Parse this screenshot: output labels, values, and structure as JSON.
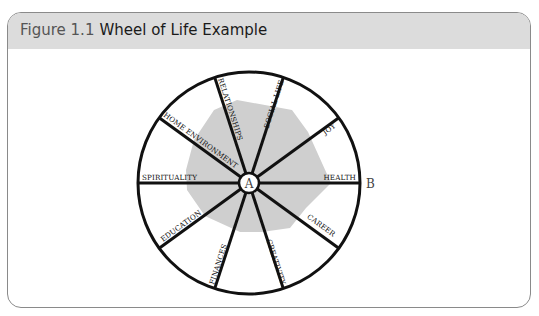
{
  "figure": {
    "number": "Figure 1.1",
    "title": "Wheel of Life Example"
  },
  "wheel": {
    "center_label": "A",
    "rim_label": "B",
    "segments": [
      {
        "label": "HEALTH",
        "angle": 0
      },
      {
        "label": "CAREER",
        "angle": 36
      },
      {
        "label": "CREATIVITY",
        "angle": 72
      },
      {
        "label": "FINANCES",
        "angle": 108
      },
      {
        "label": "EDUCATION",
        "angle": 144
      },
      {
        "label": "SPIRITUALITY",
        "angle": 180
      },
      {
        "label": "HOME ENVIRONMENT",
        "angle": 216
      },
      {
        "label": "RELATIONSHIPS",
        "angle": 252
      },
      {
        "label": "SOCIAL LIFE",
        "angle": 288
      },
      {
        "label": "JOY",
        "angle": 324
      }
    ],
    "colors": {
      "header_bg": "#dcdcdc",
      "shade": "#cfcfcf",
      "line": "#111111",
      "border": "#8a8a8a"
    }
  }
}
